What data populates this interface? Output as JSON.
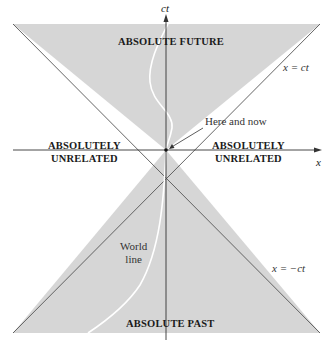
{
  "diagram": {
    "axes": {
      "vertical": "ct",
      "horizontal": "x"
    },
    "regions": {
      "future": "ABSOLUTE FUTURE",
      "past": "ABSOLUTE PAST",
      "left": [
        "ABSOLUTELY",
        "UNRELATED"
      ],
      "right": [
        "ABSOLUTELY",
        "UNRELATED"
      ]
    },
    "lines": {
      "upper": "x = ct",
      "lower": "x = −ct"
    },
    "annotations": {
      "origin": "Here and now",
      "world_line": [
        "World",
        "line"
      ]
    },
    "colors": {
      "cone_fill": "#d6d6d6",
      "axis": "#333333",
      "world_line": "#ffffff",
      "background": "#ffffff"
    }
  }
}
